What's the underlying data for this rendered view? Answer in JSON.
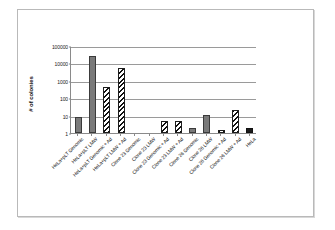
{
  "chart_data": {
    "type": "bar",
    "title": "",
    "xlabel": "",
    "ylabel": "# of colonies",
    "yscale": "log",
    "ylim": [
      1,
      100000
    ],
    "yticks": [
      1,
      10,
      100,
      1000,
      10000,
      100000
    ],
    "ytick_labels": [
      "1",
      "10",
      "100",
      "1000",
      "10000",
      "100000"
    ],
    "grid": true,
    "legend": "none",
    "categories": [
      "HeLa+pLT Genomic",
      "HeLa+pLT LMW",
      "HeLa+pLT Genomic + Ad",
      "HeLa+pLT LMW + Ad",
      "Clone 23 Genomic",
      "Clone 23 LMW",
      "Clone 23 Genomic + Ad",
      "Clone 23 LMW + Ad",
      "Clone 26 Genomic",
      "Clone 26 LMW",
      "Clone 26 Genomic + Ad",
      "Clone 26 LMW + Ad",
      "HeLa"
    ],
    "values": [
      8,
      25000,
      420,
      5500,
      1,
      1,
      5,
      5,
      2,
      11,
      1.5,
      22,
      2
    ],
    "patterns": [
      "solid",
      "solid",
      "hatch",
      "hatch",
      "solid",
      "hatch",
      "hatch",
      "hatch",
      "solid",
      "solid",
      "hatch",
      "hatch",
      "dark"
    ]
  }
}
